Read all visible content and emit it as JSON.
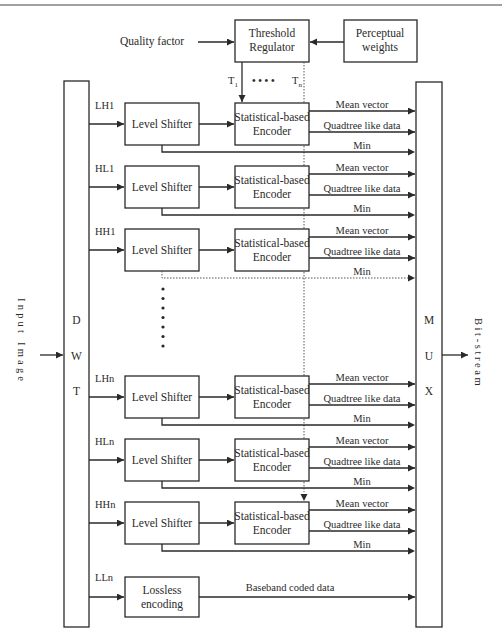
{
  "diagram": {
    "quality_factor": "Quality factor",
    "threshold_regulator": [
      "Threshold",
      "Regulator"
    ],
    "perceptual_weights": [
      "Perceptual",
      "weights"
    ],
    "t_first": "T",
    "t_first_sub": "1",
    "t_last": "T",
    "t_last_sub": "n",
    "t_dots": "• • • •",
    "dwt_letters": [
      "D",
      "W",
      "T"
    ],
    "mux_letters": [
      "M",
      "U",
      "X"
    ],
    "input_label": "Input Image",
    "output_label": "Bit-stream",
    "level_shifter_label": "Level Shifter",
    "encoder_label": [
      "Statistical-based",
      "Encoder"
    ],
    "outputs": [
      "Mean vector",
      "Quadtree like data",
      "Min"
    ],
    "bands_top": [
      "LH1",
      "HL1",
      "HH1"
    ],
    "bands_bottom": [
      "LHn",
      "HLn",
      "HHn"
    ],
    "baseband": {
      "band": "LLn",
      "box": [
        "Lossless",
        "encoding"
      ],
      "output": "Baseband coded data"
    },
    "ellipsis_dots": 7
  }
}
